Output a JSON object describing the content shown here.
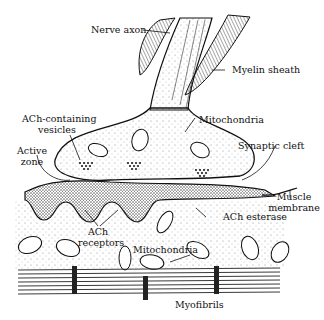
{
  "diagram": {
    "labels": {
      "nerve_axon": "Nerve axon",
      "myelin_sheath": "Myelin sheath",
      "ach_vesicles_1": "ACh-containing",
      "ach_vesicles_2": "vesicles",
      "mitochondria_top": "Mitochondria",
      "active_zone_1": "Active",
      "active_zone_2": "zone",
      "synaptic_cleft": "Synaptic cleft",
      "muscle_membrane_1": "Muscle",
      "muscle_membrane_2": "membrane",
      "ach_esterase": "ACh esterase",
      "ach_receptors_1": "ACh",
      "ach_receptors_2": "receptors",
      "mitochondria_bottom": "Mitochondria",
      "myofibrils": "Myofibrils"
    },
    "colors": {
      "ink": "#111111",
      "background": "#ffffff",
      "stipple": "#555555"
    }
  }
}
